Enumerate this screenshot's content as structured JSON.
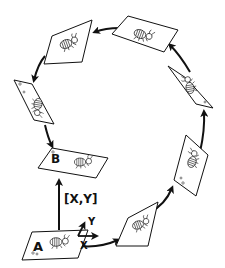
{
  "diagram": {
    "labels": {
      "frame_a": "A",
      "frame_b": "B",
      "displacement": "[X,Y]",
      "axis_x": "X",
      "axis_y": "Y"
    },
    "frames": [
      {
        "id": "A",
        "label": "A"
      },
      {
        "id": "f1",
        "label": ""
      },
      {
        "id": "f2",
        "label": ""
      },
      {
        "id": "f3",
        "label": ""
      },
      {
        "id": "f4",
        "label": ""
      },
      {
        "id": "f5",
        "label": ""
      },
      {
        "id": "f6",
        "label": ""
      },
      {
        "id": "B",
        "label": "B"
      }
    ],
    "colors": {
      "stroke": "#111111",
      "background": "#ffffff"
    }
  }
}
